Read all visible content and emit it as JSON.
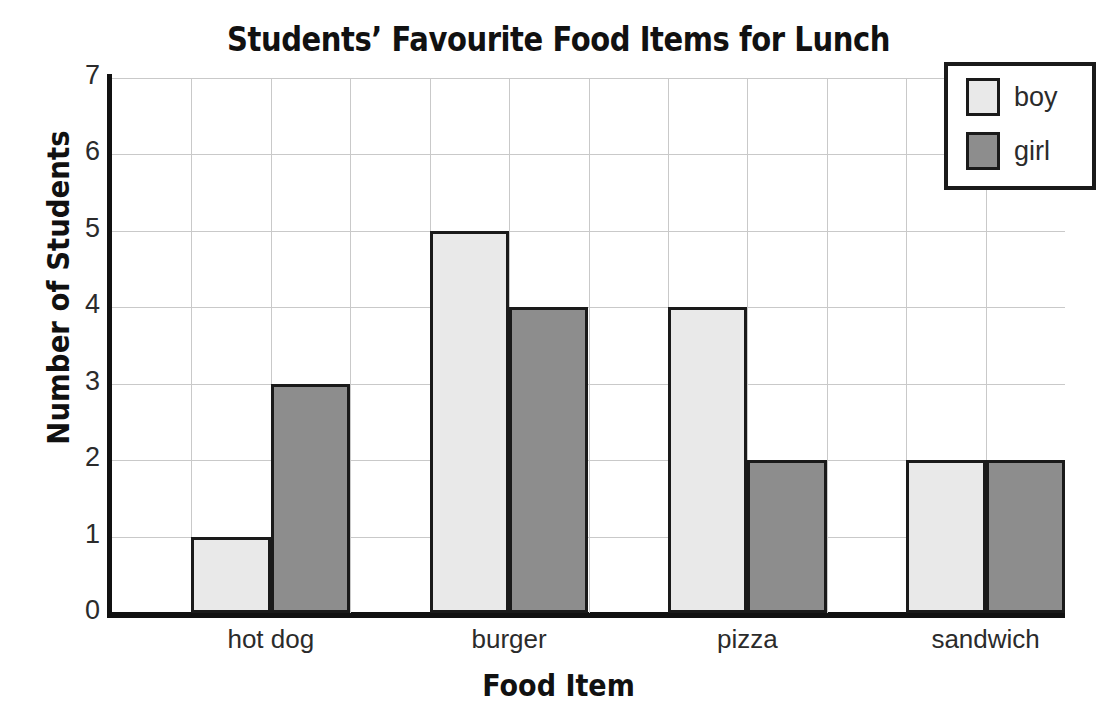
{
  "chart_data": {
    "type": "bar",
    "title": "Students’ Favourite Food Items for Lunch",
    "xlabel": "Food Item",
    "ylabel": "Number of Students",
    "categories": [
      "hot dog",
      "burger",
      "pizza",
      "sandwich"
    ],
    "series": [
      {
        "name": "boy",
        "values": [
          1,
          5,
          4,
          2
        ],
        "color": "#e9e9e9"
      },
      {
        "name": "girl",
        "values": [
          3,
          4,
          2,
          2
        ],
        "color": "#8d8d8d"
      }
    ],
    "ylim": [
      0,
      7
    ],
    "yticks": [
      "0",
      "1",
      "2",
      "3",
      "4",
      "5",
      "6",
      "7"
    ],
    "grid": true,
    "legend_position": "top-right",
    "bar_border_color": "#1a1a1a",
    "gridline_color": "#c9c9c9",
    "axis_color": "#111111"
  },
  "legend": {
    "items": [
      {
        "label": "boy"
      },
      {
        "label": "girl"
      }
    ]
  }
}
